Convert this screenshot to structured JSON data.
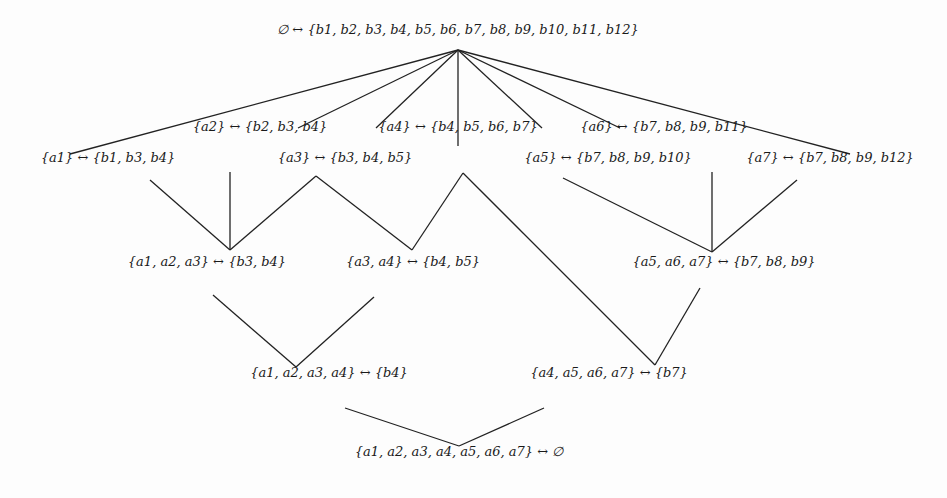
{
  "diagram": {
    "type": "concept-lattice",
    "nodes": [
      {
        "id": "top",
        "label": "∅ ↔ {b1, b2, b3, b4, b5, b6, b7, b8, b9, b10, b11, b12}",
        "x": 458,
        "y": 30
      },
      {
        "id": "a1",
        "label": "{a1} ↔ {b1, b3, b4}",
        "x": 108,
        "y": 158
      },
      {
        "id": "a2",
        "label": "{a2} ↔ {b2, b3, b4}",
        "x": 260,
        "y": 127
      },
      {
        "id": "a3",
        "label": "{a3} ↔ {b3, b4, b5}",
        "x": 345,
        "y": 158
      },
      {
        "id": "a4",
        "label": "{a4} ↔ {b4, b5, b6, b7}",
        "x": 458,
        "y": 127
      },
      {
        "id": "a5",
        "label": "{a5} ↔ {b7, b8, b9, b10}",
        "x": 608,
        "y": 158
      },
      {
        "id": "a6",
        "label": "{a6} ↔ {b7, b8, b9, b11}",
        "x": 664,
        "y": 127
      },
      {
        "id": "a7",
        "label": "{a7} ↔ {b7, b8, b9, b12}",
        "x": 830,
        "y": 158
      },
      {
        "id": "a123",
        "label": "{a1, a2, a3} ↔ {b3, b4}",
        "x": 207,
        "y": 262
      },
      {
        "id": "a34",
        "label": "{a3, a4} ↔ {b4, b5}",
        "x": 413,
        "y": 262
      },
      {
        "id": "a567",
        "label": "{a5, a6, a7} ↔ {b7, b8, b9}",
        "x": 724,
        "y": 262
      },
      {
        "id": "a1234",
        "label": "{a1, a2, a3, a4} ↔ {b4}",
        "x": 329,
        "y": 373
      },
      {
        "id": "a4567",
        "label": "{a4, a5, a6, a7} ↔ {b7}",
        "x": 609,
        "y": 373
      },
      {
        "id": "bottom",
        "label": "{a1, a2, a3, a4, a5, a6, a7} ↔ ∅",
        "x": 459,
        "y": 452
      }
    ],
    "edges": [
      [
        458,
        50,
        70,
        154
      ],
      [
        458,
        50,
        298,
        128
      ],
      [
        458,
        50,
        376,
        128
      ],
      [
        458,
        50,
        458,
        146
      ],
      [
        458,
        50,
        542,
        128
      ],
      [
        458,
        50,
        620,
        128
      ],
      [
        458,
        50,
        850,
        154
      ],
      [
        150,
        180,
        230,
        250
      ],
      [
        230,
        172,
        230,
        250
      ],
      [
        316,
        176,
        230,
        250
      ],
      [
        316,
        176,
        412,
        250
      ],
      [
        463,
        173,
        412,
        250
      ],
      [
        463,
        173,
        655,
        365
      ],
      [
        563,
        178,
        712,
        252
      ],
      [
        712,
        172,
        712,
        252
      ],
      [
        797,
        180,
        712,
        252
      ],
      [
        213,
        295,
        296,
        367
      ],
      [
        374,
        297,
        296,
        367
      ],
      [
        700,
        288,
        655,
        365
      ],
      [
        345,
        408,
        459,
        446
      ],
      [
        544,
        408,
        459,
        446
      ]
    ],
    "stroke_color": "#222222"
  }
}
